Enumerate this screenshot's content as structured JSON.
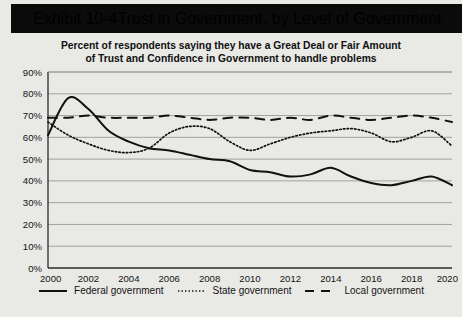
{
  "exhibit": {
    "number": "Exhibit 10-4",
    "title": "Trust in Government, by Level of Government"
  },
  "subtitle": {
    "line1": "Percent of respondents saying they have a Great Deal or Fair Amount",
    "line2": "of Trust and Confidence in Government to handle problems"
  },
  "legend": {
    "federal": "Federal government",
    "state": "State government",
    "local": "Local government"
  },
  "colors": {
    "background": "#e9e9e6",
    "title_bar": "#0b0b0b",
    "title_text": "#ffffff",
    "line": "#111111",
    "grid": "#9a9a96",
    "axis": "#2a2a2a"
  },
  "chart_data": {
    "type": "line",
    "title": "Trust in Government, by Level of Government",
    "subtitle": "Percent of respondents saying they have a Great Deal or Fair Amount of Trust and Confidence in Government to handle problems",
    "xlabel": "",
    "ylabel": "",
    "xlim": [
      2000,
      2020
    ],
    "ylim": [
      0,
      90
    ],
    "ytick_values": [
      0,
      10,
      20,
      30,
      40,
      50,
      60,
      70,
      80,
      90
    ],
    "ytick_labels": [
      "0%",
      "10%",
      "20%",
      "30%",
      "40%",
      "50%",
      "60%",
      "70%",
      "80%",
      "90%"
    ],
    "xtick_values": [
      2000,
      2002,
      2004,
      2006,
      2008,
      2010,
      2012,
      2014,
      2016,
      2018,
      2020
    ],
    "xtick_labels": [
      "2000",
      "2002",
      "2004",
      "2006",
      "2008",
      "2010",
      "2012",
      "2014",
      "2016",
      "2018",
      "2020"
    ],
    "grid": true,
    "grid_axis": "y",
    "legend_position": "bottom",
    "x": [
      2000,
      2001,
      2002,
      2003,
      2004,
      2005,
      2006,
      2007,
      2008,
      2009,
      2010,
      2011,
      2012,
      2013,
      2014,
      2015,
      2016,
      2017,
      2018,
      2019,
      2020
    ],
    "series": [
      {
        "name": "Federal government",
        "style": "solid",
        "values": [
          61,
          78,
          73,
          63,
          58,
          55,
          54,
          52,
          50,
          49,
          45,
          44,
          42,
          43,
          46,
          42,
          39,
          38,
          40,
          42,
          38
        ]
      },
      {
        "name": "State government",
        "style": "dotted",
        "values": [
          67,
          61,
          57,
          54,
          53,
          55,
          62,
          65,
          64,
          58,
          54,
          57,
          60,
          62,
          63,
          64,
          62,
          58,
          60,
          63,
          56
        ]
      },
      {
        "name": "Local government",
        "style": "dashed",
        "values": [
          69,
          69,
          70,
          69,
          69,
          69,
          70,
          69,
          68,
          69,
          69,
          68,
          69,
          68,
          70,
          69,
          68,
          69,
          70,
          69,
          67
        ]
      }
    ]
  }
}
